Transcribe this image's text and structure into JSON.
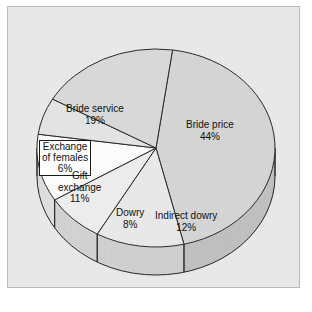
{
  "figure": {
    "background_color": "#ffffff",
    "panel_color": "#e8e8e8",
    "panel_border_color": "#b9b9b9"
  },
  "chart_data": {
    "type": "pie",
    "title": "",
    "subtitle": "",
    "xlabel": "",
    "ylabel": "",
    "grid": false,
    "legend_position": "none",
    "style": "3d-pie",
    "value_unit": "%",
    "total": 100,
    "categories": [
      "Bride price",
      "Indirect dowry",
      "Dowry",
      "Gift exchange",
      "Exchange of females",
      "Bride service"
    ],
    "values": [
      44,
      12,
      8,
      11,
      6,
      19
    ],
    "labels": [
      "Bride price\n44%",
      "Indirect dowry\n12%",
      "Dowry\n8%",
      "Gift\nexchange\n11%",
      "Exchange\nof females\n6%",
      "Bride service\n19%"
    ],
    "slices": [
      {
        "name": "Bride price",
        "label_line1": "Bride price",
        "label_line2": "44%",
        "value": 44,
        "percent": "44%",
        "color": "#d4d4d4",
        "side_color": "#bfbfbf",
        "boxed_label": false
      },
      {
        "name": "Indirect dowry",
        "label_line1": "Indirect dowry",
        "label_line2": "12%",
        "value": 12,
        "percent": "12%",
        "color": "#e8e8e8",
        "side_color": "#cfcfcf",
        "boxed_label": false
      },
      {
        "name": "Dowry",
        "label_line1": "Dowry",
        "label_line2": "8%",
        "value": 8,
        "percent": "8%",
        "color": "#ececec",
        "side_color": "#d2d2d2",
        "boxed_label": false
      },
      {
        "name": "Gift exchange",
        "label_line1": "Gift",
        "label_line2": "exchange",
        "label_line3": "11%",
        "value": 11,
        "percent": "11%",
        "color": "#fbfbfb",
        "side_color": "#dedede",
        "boxed_label": false
      },
      {
        "name": "Exchange of females",
        "label_line1": "Exchange",
        "label_line2": "of females",
        "label_line3": "6%",
        "value": 6,
        "percent": "6%",
        "color": "#e3e3e3",
        "side_color": "#cacaca",
        "boxed_label": true
      },
      {
        "name": "Bride service",
        "label_line1": "Bride service",
        "label_line2": "19%",
        "value": 19,
        "percent": "19%",
        "color": "#d8d8d8",
        "side_color": "#c2c2c2",
        "boxed_label": false
      }
    ],
    "geometry": {
      "center_x": 155,
      "center_y": 147,
      "radius_x": 119,
      "radius_y": 99,
      "depth": 28,
      "start_angle_deg": -82,
      "direction": "clockwise"
    }
  }
}
